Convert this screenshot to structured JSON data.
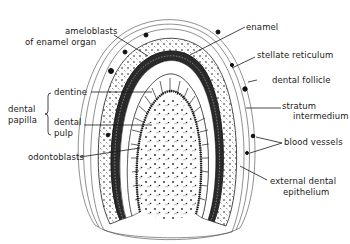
{
  "diagram": {
    "labels": {
      "ameloblasts_line1": "ameloblasts",
      "ameloblasts_line2": "of enamel organ",
      "dental_papilla_line1": "dental",
      "dental_papilla_line2": "papilla",
      "dentine": "dentine",
      "dental_pulp_line1": "dental",
      "dental_pulp_line2": "pulp",
      "odontoblasts": "odontoblasts",
      "enamel": "enamel",
      "stellate_reticulum": "stellate reticulum",
      "dental_follicle": "dental follicle",
      "stratum_intermedium_line1": "stratum",
      "stratum_intermedium_line2": "intermedium",
      "blood_vessels": "blood vessels",
      "external_dental_epithelium_line1": "external dental",
      "external_dental_epithelium_line2": "epithelium"
    },
    "colors": {
      "ink": "#1a1a1a",
      "background": "#ffffff"
    }
  }
}
